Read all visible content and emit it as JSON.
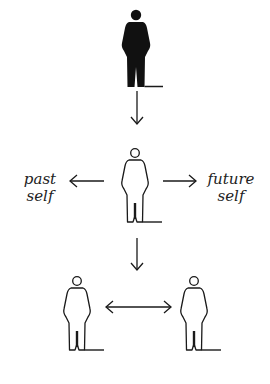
{
  "diagram": {
    "labels": {
      "past_line1": "past",
      "past_line2": "self",
      "future_line1": "future",
      "future_line2": "self"
    },
    "figures": [
      {
        "id": "top",
        "style": "filled",
        "cx": 136,
        "head_cy": 15
      },
      {
        "id": "middle",
        "style": "outline",
        "cx": 135,
        "head_cy": 153
      },
      {
        "id": "bottom-left",
        "style": "outline",
        "cx": 76,
        "head_cy": 281
      },
      {
        "id": "bottom-right",
        "style": "outline",
        "cx": 194,
        "head_cy": 281
      }
    ],
    "arrows": [
      {
        "id": "top-to-middle",
        "direction": "down"
      },
      {
        "id": "middle-to-past",
        "direction": "left"
      },
      {
        "id": "middle-to-future",
        "direction": "right"
      },
      {
        "id": "middle-to-bottom",
        "direction": "down"
      },
      {
        "id": "bottom-between",
        "direction": "both"
      }
    ],
    "colors": {
      "ink": "#1a1a1a",
      "background": "#ffffff"
    }
  }
}
